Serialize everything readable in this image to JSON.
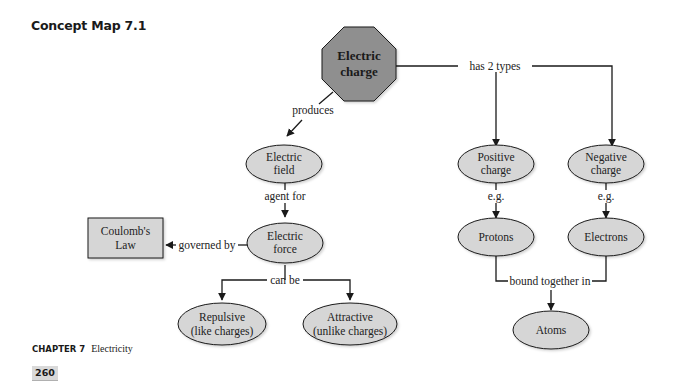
{
  "title": "Concept Map 7.1",
  "colors": {
    "octagon_fill": "#8f8f8f",
    "node_fill": "#d6d6d6",
    "stroke": "#1a1a1a",
    "page_badge": "#d9d9d9"
  },
  "nodes": {
    "electric_charge": [
      "Electric",
      "charge"
    ],
    "electric_field": [
      "Electric",
      "field"
    ],
    "electric_force": [
      "Electric",
      "force"
    ],
    "coulombs_law": [
      "Coulomb's",
      "Law"
    ],
    "repulsive": [
      "Repulsive",
      "(like charges)"
    ],
    "attractive": [
      "Attractive",
      "(unlike charges)"
    ],
    "positive_charge": [
      "Positive",
      "charge"
    ],
    "negative_charge": [
      "Negative",
      "charge"
    ],
    "protons": "Protons",
    "electrons": "Electrons",
    "atoms": "Atoms"
  },
  "links": {
    "produces": "produces",
    "has_2_types": "has 2 types",
    "agent_for": "agent for",
    "governed_by": "governed by",
    "can_be": "can be",
    "eg_positive": "e.g.",
    "eg_negative": "e.g.",
    "bound_together_in": "bound together in"
  },
  "footer": {
    "chapter_label": "CHAPTER 7",
    "chapter_name": "Electricity",
    "page_number": "260"
  }
}
